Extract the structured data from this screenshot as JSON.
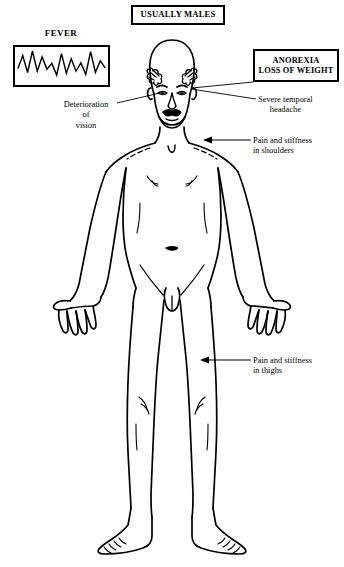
{
  "page": {
    "background_color": "#ffffff",
    "ink_color": "#000000",
    "width": 344,
    "height": 567
  },
  "boxes": {
    "usually_males": {
      "label": "USUALLY MALES"
    },
    "fever": {
      "title": "FEVER"
    },
    "anorexia": {
      "line1": "ANOREXIA",
      "line2": "LOSS OF WEIGHT"
    }
  },
  "annotations": {
    "vision": {
      "line1": "Deterioration",
      "line2": "of",
      "line3": "vision"
    },
    "headache": {
      "line1": "Severe temporal",
      "line2": "headache"
    },
    "shoulders": {
      "line1": "Pain and stiffness",
      "line2": "in shoulders"
    },
    "thighs": {
      "line1": "Pain and stiffness",
      "line2": "in thighs"
    }
  },
  "chart_data": {
    "type": "line",
    "title": "FEVER",
    "xlabel": "",
    "ylabel": "",
    "grid": false,
    "legend": null,
    "x": [
      0,
      1,
      2,
      3,
      4,
      5,
      6,
      7,
      8,
      9,
      10,
      11,
      12,
      13,
      14,
      15,
      16,
      17,
      18
    ],
    "values": [
      42,
      82,
      30,
      96,
      34,
      78,
      40,
      58,
      22,
      88,
      28,
      72,
      34,
      60,
      24,
      94,
      30,
      66,
      44
    ],
    "ylim": [
      0,
      100
    ],
    "xlim": [
      0,
      18
    ]
  },
  "figure": {
    "stroke_color": "#000000"
  }
}
